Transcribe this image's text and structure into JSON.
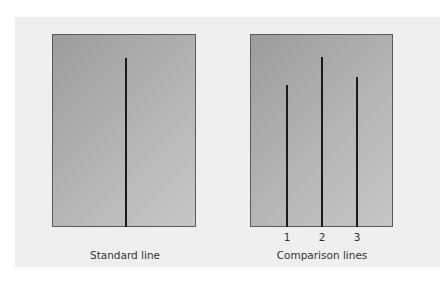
{
  "figure": {
    "standard": {
      "label": "Standard line",
      "line": {
        "x": 125,
        "top": 58
      }
    },
    "comparison": {
      "label": "Comparison lines",
      "lines": [
        {
          "number": "1",
          "x": 286,
          "top": 85
        },
        {
          "number": "2",
          "x": 321,
          "top": 57
        },
        {
          "number": "3",
          "x": 356,
          "top": 77
        }
      ]
    }
  },
  "colors": {
    "panel": "#efefef",
    "card_dark": "#9c9c9c",
    "card_light": "#c6c6c6",
    "line": "#1a1a1a"
  }
}
